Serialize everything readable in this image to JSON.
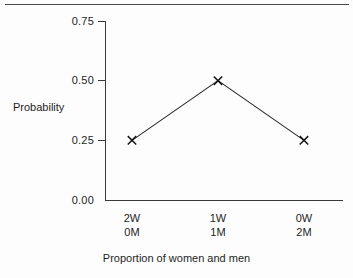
{
  "chart_data": {
    "type": "line",
    "title": "",
    "xlabel": "Proportion of women and men",
    "ylabel": "Probability",
    "categories": [
      "2W 0M",
      "1W 1M",
      "0W 2M"
    ],
    "category_lines": [
      {
        "top": "2W",
        "bottom": "0M"
      },
      {
        "top": "1W",
        "bottom": "1M"
      },
      {
        "top": "0W",
        "bottom": "2M"
      }
    ],
    "values": [
      0.25,
      0.5,
      0.25
    ],
    "ylim": [
      0.0,
      0.75
    ],
    "yticks": [
      "0.00",
      "0.25",
      "0.50",
      "0.75"
    ],
    "ytick_values": [
      0.0,
      0.25,
      0.5,
      0.75
    ],
    "grid": false,
    "legend": "none",
    "marker": "x",
    "line_color": "#2b2b2b",
    "axis_color": "#3a3a3a"
  },
  "axes": {
    "y_title": "Probability",
    "x_title": "Proportion of women and men",
    "ytick_labels": [
      "0.75",
      "0.50",
      "0.25",
      "0.00"
    ]
  }
}
